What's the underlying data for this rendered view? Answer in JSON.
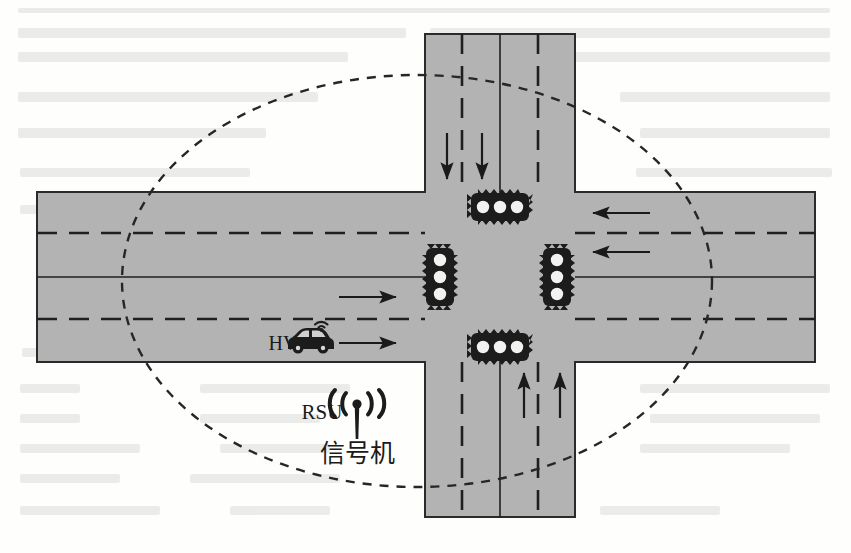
{
  "figure": {
    "background_color": "#fefefd",
    "road_color": "#b3b3b3",
    "road_edge_color": "#2b2b2b",
    "marking_color": "#1f1f1f",
    "coverage_color": "#262626"
  },
  "labels": {
    "host_vehicle": "HV",
    "rsu": "RSU",
    "rsu_cn": "信号机"
  },
  "geometry": {
    "horizontal_road": {
      "x": 37,
      "y": 192,
      "width": 778,
      "height": 170
    },
    "vertical_road": {
      "x": 425,
      "y": 34,
      "width": 150,
      "height": 483
    },
    "h_center_line_y": 277,
    "h_dash_top_y": 233,
    "h_dash_bottom_y": 319,
    "v_center_line_x": 500,
    "v_dash_left_x": 462,
    "v_dash_right_x": 538,
    "coverage_ellipse": {
      "cx": 417,
      "cy": 281,
      "rx": 295,
      "ry": 206
    }
  },
  "traffic_lights": [
    {
      "name": "north-approach-signal",
      "orientation": "horizontal",
      "x": 500,
      "y": 207,
      "lamps": 3
    },
    {
      "name": "south-approach-signal",
      "orientation": "horizontal",
      "x": 500,
      "y": 347,
      "lamps": 3
    },
    {
      "name": "west-approach-signal",
      "orientation": "vertical",
      "x": 440,
      "y": 277,
      "lamps": 3
    },
    {
      "name": "east-approach-signal",
      "orientation": "vertical",
      "x": 557,
      "y": 277,
      "lamps": 3
    }
  ],
  "flow_arrows": [
    {
      "name": "southbound-lane-1-arrow",
      "direction": "down",
      "x": 447,
      "y1": 133,
      "y2": 180
    },
    {
      "name": "southbound-lane-2-arrow",
      "direction": "down",
      "x": 482,
      "y1": 133,
      "y2": 180
    },
    {
      "name": "northbound-lane-1-arrow",
      "direction": "up",
      "x": 524,
      "y1": 417,
      "y2": 372
    },
    {
      "name": "northbound-lane-2-arrow",
      "direction": "up",
      "x": 560,
      "y1": 417,
      "y2": 372
    },
    {
      "name": "westbound-lane-1-arrow",
      "direction": "left",
      "y": 213,
      "x1": 648,
      "x2": 592
    },
    {
      "name": "westbound-lane-2-arrow",
      "direction": "left",
      "y": 252,
      "x1": 648,
      "x2": 592
    },
    {
      "name": "eastbound-lane-1-arrow",
      "direction": "right",
      "y": 297,
      "x1": 340,
      "x2": 396
    },
    {
      "name": "eastbound-vehicle-arrow",
      "direction": "right",
      "y": 343,
      "x1": 340,
      "x2": 396
    }
  ],
  "vehicle": {
    "name": "host-vehicle",
    "label": "HV",
    "x": 310,
    "y": 343,
    "has_v2x_antenna": true
  },
  "rsu_marker": {
    "name": "rsu-antenna",
    "x": 357,
    "y": 412,
    "label": "RSU",
    "sublabel": "信号机"
  }
}
